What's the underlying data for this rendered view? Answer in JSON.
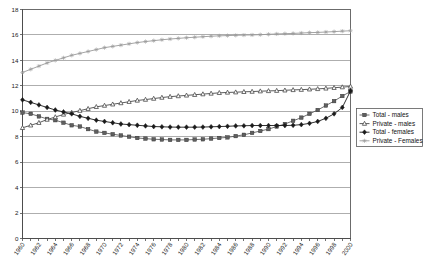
{
  "chart_data": {
    "type": "line",
    "title": "",
    "xlabel": "",
    "ylabel": "",
    "grid": true,
    "legend_position": "right-middle",
    "xlim": [
      1960,
      2000
    ],
    "ylim": [
      0,
      18
    ],
    "y_ticks": [
      0,
      2,
      4,
      6,
      8,
      10,
      12,
      14,
      16,
      18
    ],
    "x_tick_step": 2,
    "x": [
      1960,
      1961,
      1962,
      1963,
      1964,
      1965,
      1966,
      1967,
      1968,
      1969,
      1970,
      1971,
      1972,
      1973,
      1974,
      1975,
      1976,
      1977,
      1978,
      1979,
      1980,
      1981,
      1982,
      1983,
      1984,
      1985,
      1986,
      1987,
      1988,
      1989,
      1990,
      1991,
      1992,
      1993,
      1994,
      1995,
      1996,
      1997,
      1998,
      1999,
      2000
    ],
    "x_tick_labels": [
      "1960",
      "1962",
      "1964",
      "1966",
      "1968",
      "1970",
      "1972",
      "1974",
      "1976",
      "1978",
      "1980",
      "1982",
      "1984",
      "1986",
      "1988",
      "1990",
      "1992",
      "1994",
      "1996",
      "1998",
      "2000"
    ],
    "series": [
      {
        "name": "Total - males",
        "marker": "square",
        "color": "#5f5f5f",
        "values": [
          9.9,
          9.8,
          9.6,
          9.4,
          9.3,
          9.1,
          8.9,
          8.8,
          8.6,
          8.4,
          8.3,
          8.2,
          8.1,
          8.0,
          7.9,
          7.85,
          7.8,
          7.78,
          7.75,
          7.75,
          7.75,
          7.78,
          7.8,
          7.85,
          7.9,
          7.95,
          8.05,
          8.15,
          8.3,
          8.45,
          8.6,
          8.8,
          9.0,
          9.25,
          9.5,
          9.8,
          10.1,
          10.45,
          10.8,
          11.2,
          11.55
        ]
      },
      {
        "name": "Private - males",
        "marker": "triangle",
        "color": "#4a4a4a",
        "values": [
          8.7,
          8.9,
          9.1,
          9.35,
          9.55,
          9.75,
          9.9,
          10.05,
          10.2,
          10.35,
          10.45,
          10.55,
          10.65,
          10.75,
          10.85,
          10.92,
          11.0,
          11.08,
          11.15,
          11.2,
          11.25,
          11.3,
          11.35,
          11.4,
          11.45,
          11.48,
          11.5,
          11.53,
          11.55,
          11.58,
          11.6,
          11.62,
          11.65,
          11.68,
          11.7,
          11.73,
          11.76,
          11.8,
          11.85,
          11.9,
          11.95
        ]
      },
      {
        "name": "Total - females",
        "marker": "diamond",
        "color": "#1a1a1a",
        "values": [
          10.9,
          10.7,
          10.5,
          10.3,
          10.1,
          9.95,
          9.8,
          9.6,
          9.45,
          9.3,
          9.2,
          9.1,
          9.0,
          8.95,
          8.9,
          8.85,
          8.8,
          8.78,
          8.76,
          8.75,
          8.75,
          8.75,
          8.76,
          8.78,
          8.8,
          8.82,
          8.85,
          8.86,
          8.88,
          8.88,
          8.88,
          8.88,
          8.88,
          8.9,
          8.95,
          9.05,
          9.2,
          9.45,
          9.8,
          10.3,
          11.6
        ]
      },
      {
        "name": "Private - Females",
        "marker": "star",
        "color": "#9a9a9a",
        "values": [
          13.05,
          13.3,
          13.55,
          13.8,
          14.0,
          14.2,
          14.4,
          14.55,
          14.7,
          14.85,
          15.0,
          15.1,
          15.2,
          15.3,
          15.4,
          15.48,
          15.55,
          15.62,
          15.68,
          15.73,
          15.78,
          15.82,
          15.86,
          15.9,
          15.93,
          15.95,
          15.97,
          15.99,
          16.0,
          16.02,
          16.05,
          16.08,
          16.1,
          16.12,
          16.15,
          16.18,
          16.2,
          16.23,
          16.26,
          16.3,
          16.33
        ]
      }
    ]
  },
  "legend": {
    "items": [
      {
        "label": "Total - males"
      },
      {
        "label": "Private - males"
      },
      {
        "label": "Total - females"
      },
      {
        "label": "Private - Females"
      }
    ]
  }
}
